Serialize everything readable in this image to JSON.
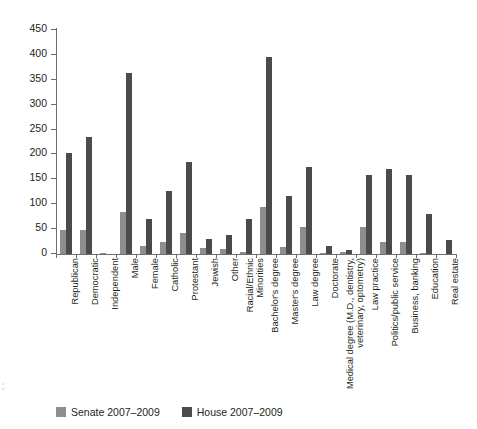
{
  "chart_data": {
    "type": "bar",
    "title": "",
    "xlabel": "",
    "ylabel": "",
    "ylim": [
      0,
      450
    ],
    "yticks": [
      0,
      50,
      100,
      150,
      200,
      250,
      300,
      350,
      400,
      450
    ],
    "grid": false,
    "legend_position": "bottom-left",
    "categories": [
      "Republican",
      "Democratic",
      "Independent",
      "Male",
      "Female",
      "Catholic",
      "Protestant",
      "Jewish",
      "Other",
      "Racial/Ethnic Minorities",
      "Bachelor's degree",
      "Master's degree",
      "Law degree",
      "Doctorate",
      "Medical degree (M.D., dentistry, veterinary, optometry)",
      "Law practice",
      "Politics/public service",
      "Business, banking",
      "Education",
      "Real estate"
    ],
    "category_lines": [
      [
        "Republican"
      ],
      [
        "Democratic"
      ],
      [
        "Independent"
      ],
      [
        "Male"
      ],
      [
        "Female"
      ],
      [
        "Catholic"
      ],
      [
        "Protestant"
      ],
      [
        "Jewish"
      ],
      [
        "Other"
      ],
      [
        "Racial/Ethnic",
        "Minorities"
      ],
      [
        "Bachelor's degree"
      ],
      [
        "Master's degree"
      ],
      [
        "Law degree"
      ],
      [
        "Doctorate"
      ],
      [
        "Medical degree (M.D., dentistry,",
        "veterinary, optometry)"
      ],
      [
        "Law practice"
      ],
      [
        "Politics/public service"
      ],
      [
        "Business, banking"
      ],
      [
        "Education"
      ],
      [
        "Real estate"
      ]
    ],
    "series": [
      {
        "name": "Senate 2007-2009",
        "color": "#8e8e8e",
        "values": [
          49,
          49,
          2,
          84,
          16,
          25,
          43,
          13,
          11,
          5,
          94,
          15,
          54,
          2,
          4,
          54,
          24,
          25,
          2,
          0
        ]
      },
      {
        "name": "House 2007-2009",
        "color": "#4b4b4b",
        "values": [
          203,
          236,
          0,
          363,
          71,
          126,
          185,
          30,
          39,
          71,
          396,
          117,
          175,
          16,
          9,
          158,
          170,
          159,
          81,
          29
        ]
      }
    ]
  },
  "legend": {
    "items": [
      {
        "label": "Senate 2007–2009",
        "color": "#8e8e8e",
        "swatch": "senate"
      },
      {
        "label": "House 2007–2009",
        "color": "#4b4b4b",
        "swatch": "house"
      }
    ]
  },
  "margin_note": {
    "line1": "s",
    "line2": "e"
  }
}
